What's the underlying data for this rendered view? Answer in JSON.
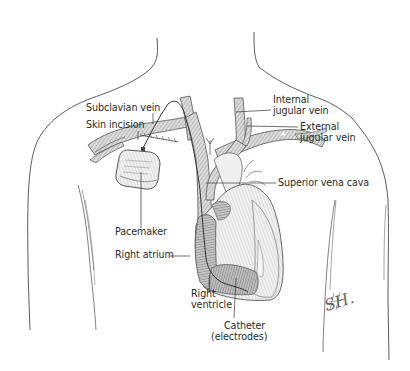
{
  "figure": {
    "colors": {
      "outline": "#4a4a4a",
      "vessel_fill": "#d4d4d4",
      "vessel_hatch": "#8a8a8a",
      "heart_fill": "#e9e9e9",
      "atrium_fill": "#b9b9b9",
      "label_text": "#2a2a2a",
      "background": "#ffffff"
    },
    "labels": {
      "subclavian_vein": "Subclavian vein",
      "skin_incision": "Skin incision",
      "internal_jugular_line1": "Internal",
      "internal_jugular_line2": "jugular vein",
      "external_jugular_line1": "External",
      "external_jugular_line2": "jugular vein",
      "superior_vena_cava": "Superior vena cava",
      "pacemaker": "Pacemaker",
      "right_atrium": "Right atrium",
      "right_ventricle_line1": "Right",
      "right_ventricle_line2": "ventricle",
      "catheter_line1": "Catheter",
      "catheter_line2": "(electrodes)"
    },
    "signature": "SH."
  }
}
